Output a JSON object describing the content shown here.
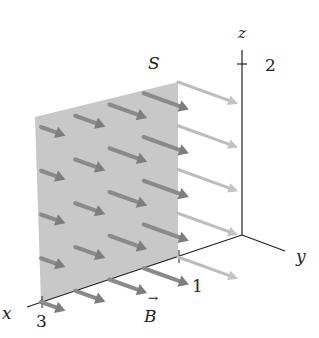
{
  "figure": {
    "surface_label": "S",
    "field_label": "B",
    "axes": {
      "x": {
        "label": "x",
        "tick_label": "3"
      },
      "y": {
        "label": "y",
        "tick_label": "1"
      },
      "z": {
        "label": "z",
        "tick_label": "2"
      }
    },
    "colors": {
      "surface": "#c8c8c8",
      "axis": "#222222",
      "arrow_dark": "#7a7a7a",
      "arrow_light": "#cfcfcf"
    },
    "arrow_grid": {
      "columns": 5,
      "rows": 5,
      "direction": "+y"
    }
  }
}
